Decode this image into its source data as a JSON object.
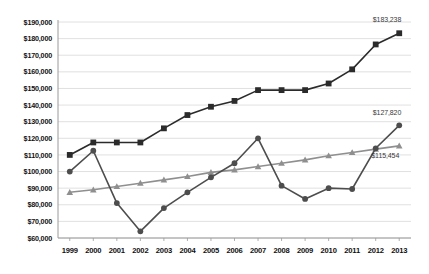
{
  "chart_data": {
    "type": "line",
    "title": "",
    "subtitle": "",
    "xlabel": "",
    "ylabel": "",
    "grid": true,
    "gridlines": "horizontal",
    "legend_position": "none",
    "ylim": [
      60000,
      190000
    ],
    "ytick_step": 10000,
    "categories": [
      "1999",
      "2000",
      "2001",
      "2002",
      "2003",
      "2004",
      "2005",
      "2006",
      "2007",
      "2008",
      "2009",
      "2010",
      "2011",
      "2012",
      "2013"
    ],
    "ytick_labels": [
      "$190,000",
      "$180,000",
      "$170,000",
      "$160,000",
      "$150,000",
      "$140,000",
      "$130,000",
      "$120,000",
      "$110,000",
      "$100,000",
      "$90,000",
      "$80,000",
      "$70,000",
      "$60,000"
    ],
    "ytick_values": [
      190000,
      180000,
      170000,
      160000,
      150000,
      140000,
      130000,
      120000,
      110000,
      100000,
      90000,
      80000,
      70000,
      60000
    ],
    "series": [
      {
        "name": "series-squares",
        "marker": "square",
        "color": "#2b2b2b",
        "values": [
          110000,
          117500,
          117500,
          117500,
          126000,
          134000,
          139000,
          142500,
          149000,
          149000,
          149000,
          153000,
          161500,
          176500,
          183238
        ],
        "end_label": "$183,238"
      },
      {
        "name": "series-circles",
        "marker": "circle",
        "color": "#4d4d4d",
        "values": [
          100000,
          112500,
          81000,
          64000,
          78000,
          87500,
          96500,
          105000,
          120000,
          91500,
          83500,
          90000,
          89500,
          114000,
          127820
        ],
        "end_label": "$127,820"
      },
      {
        "name": "series-triangles",
        "marker": "triangle",
        "color": "#8f8f8f",
        "values": [
          87500,
          89000,
          91000,
          93000,
          95000,
          97000,
          99500,
          101000,
          103000,
          105000,
          107000,
          109500,
          111500,
          113500,
          115454
        ],
        "end_label": "$115,454"
      }
    ],
    "annotations": [
      {
        "id": "label-squares-end",
        "text": "$183,238"
      },
      {
        "id": "label-circles-end",
        "text": "$127,820"
      },
      {
        "id": "label-triangles-end",
        "text": "$115,454"
      }
    ],
    "colors": {
      "axis": "#9a9a9a",
      "grid": "#d8d8d8",
      "background": "#ffffff",
      "text": "#111111",
      "annotation_text": "#3a3a3a"
    }
  }
}
